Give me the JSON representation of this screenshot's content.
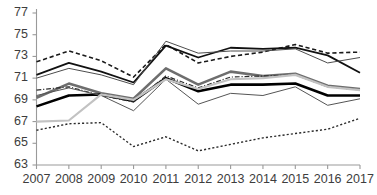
{
  "chart_data": {
    "type": "line",
    "title": "",
    "xlabel": "",
    "ylabel": "",
    "x": [
      2007,
      2008,
      2009,
      2010,
      2011,
      2012,
      2013,
      2014,
      2015,
      2016,
      2017
    ],
    "categories": [
      "2007",
      "2008",
      "2009",
      "2010",
      "2011",
      "2012",
      "2013",
      "2014",
      "2015",
      "2016",
      "2017"
    ],
    "xtick_labels": [
      "2007",
      "2008",
      "2009",
      "2010",
      "2011",
      "2012",
      "2013",
      "2014",
      "2015",
      "2016",
      "2017"
    ],
    "ytick_labels": [
      "77",
      "75",
      "73",
      "71",
      "69",
      "67",
      "65",
      "63"
    ],
    "yticks": [
      77,
      75,
      73,
      71,
      69,
      67,
      65,
      63
    ],
    "ylim": [
      63,
      77
    ],
    "xlim": [
      2007,
      2017
    ],
    "grid": false,
    "legend": "none",
    "series": [
      {
        "name": "series-dashed-upper",
        "style": "dashed",
        "color": "#1a1a1a",
        "width": 1.6,
        "values": [
          72.5,
          73.5,
          72.6,
          71.1,
          74.1,
          72.4,
          73.0,
          73.4,
          74.1,
          73.3,
          73.4
        ]
      },
      {
        "name": "series-solid-upper-bold",
        "style": "solid",
        "color": "#111111",
        "width": 1.8,
        "values": [
          71.3,
          72.4,
          71.6,
          70.6,
          74.0,
          72.9,
          73.8,
          73.7,
          73.8,
          73.1,
          71.5
        ]
      },
      {
        "name": "series-solid-upper-thin",
        "style": "solid",
        "color": "#4d4d4d",
        "width": 1.0,
        "values": [
          71.0,
          71.9,
          71.3,
          70.4,
          74.4,
          73.3,
          73.5,
          73.5,
          73.7,
          72.4,
          72.9
        ]
      },
      {
        "name": "series-gray-mid-bold",
        "style": "solid",
        "color": "#6e6e6e",
        "width": 2.6,
        "values": [
          69.2,
          70.5,
          69.6,
          69.1,
          71.9,
          70.4,
          71.6,
          71.2,
          71.4,
          70.3,
          70.0
        ]
      },
      {
        "name": "series-black-mid-bold",
        "style": "solid",
        "color": "#000000",
        "width": 2.6,
        "values": [
          68.4,
          69.4,
          69.5,
          68.9,
          71.0,
          69.8,
          70.4,
          70.4,
          70.5,
          69.4,
          69.4
        ]
      },
      {
        "name": "series-dashdot-mid",
        "style": "dashdot",
        "color": "#2b2b2b",
        "width": 1.2,
        "values": [
          69.9,
          70.2,
          69.4,
          68.8,
          71.2,
          70.1,
          71.1,
          71.2,
          71.3,
          70.2,
          69.9
        ]
      },
      {
        "name": "series-thin-lower",
        "style": "solid",
        "color": "#555555",
        "width": 1.0,
        "values": [
          69.4,
          70.1,
          69.4,
          68.0,
          70.9,
          68.6,
          69.6,
          69.4,
          70.2,
          68.5,
          69.1
        ]
      },
      {
        "name": "series-lightgray-partial",
        "style": "solid",
        "color": "#c2c2c2",
        "width": 2.2,
        "values": [
          67.0,
          67.1,
          69.5,
          69.0,
          70.9,
          70.0,
          70.9,
          71.0,
          71.3,
          70.2,
          69.9
        ]
      },
      {
        "name": "series-dotted-bottom",
        "style": "dotted",
        "color": "#2b2b2b",
        "width": 1.4,
        "values": [
          66.2,
          66.8,
          66.9,
          64.7,
          65.6,
          64.3,
          64.9,
          65.5,
          65.9,
          66.3,
          67.3
        ]
      }
    ]
  },
  "axis": {
    "y_axis_name": "y-axis",
    "x_axis_name": "x-axis"
  }
}
